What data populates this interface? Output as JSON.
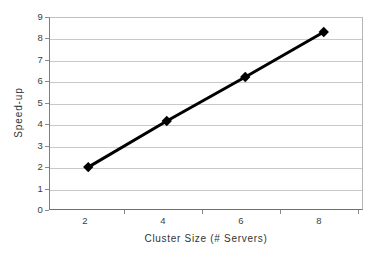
{
  "chart_data": {
    "type": "line",
    "title": "",
    "xlabel": "Cluster Size (# Servers)",
    "ylabel": "Speed-up",
    "x": [
      2,
      4,
      6,
      8
    ],
    "values": [
      2.0,
      4.15,
      6.2,
      8.3
    ],
    "series": [
      {
        "name": "Speed-up",
        "x": [
          2,
          4,
          6,
          8
        ],
        "values": [
          2.0,
          4.15,
          6.2,
          8.3
        ],
        "color": "#000000",
        "marker": "diamond",
        "line_width": 3
      }
    ],
    "xlim": [
      1,
      9
    ],
    "ylim": [
      0,
      9
    ],
    "xticks": [
      2,
      4,
      6,
      8
    ],
    "xtick_labels": [
      "2",
      "4",
      "6",
      "8"
    ],
    "yticks": [
      0,
      1,
      2,
      3,
      4,
      5,
      6,
      7,
      8,
      9
    ],
    "ytick_labels": [
      "0",
      "1",
      "2",
      "3",
      "4",
      "5",
      "6",
      "7",
      "8",
      "9"
    ],
    "grid": "horizontal",
    "grid_color": "#c9c9c9",
    "legend": "none",
    "background": "#ffffff",
    "axis_color": "#6f6f6f"
  }
}
